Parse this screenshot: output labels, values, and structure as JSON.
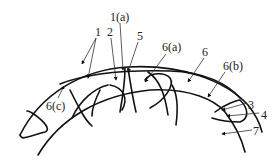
{
  "diagram": {
    "labels": [
      {
        "id": "1",
        "text": "1",
        "x": 95,
        "y": 26
      },
      {
        "id": "2",
        "text": "2",
        "x": 107,
        "y": 26
      },
      {
        "id": "1a",
        "text": "1(a)",
        "x": 110,
        "y": 11
      },
      {
        "id": "5",
        "text": "5",
        "x": 137,
        "y": 30
      },
      {
        "id": "6a",
        "text": "6(a)",
        "x": 162,
        "y": 41
      },
      {
        "id": "6",
        "text": "6",
        "x": 202,
        "y": 46
      },
      {
        "id": "6b",
        "text": "6(b)",
        "x": 223,
        "y": 60
      },
      {
        "id": "6c",
        "text": "6(c)",
        "x": 46,
        "y": 100
      },
      {
        "id": "3",
        "text": "3",
        "x": 248,
        "y": 99
      },
      {
        "id": "4",
        "text": "4",
        "x": 261,
        "y": 109
      },
      {
        "id": "7",
        "text": "7",
        "x": 253,
        "y": 125
      }
    ],
    "stroke_color": "#111111"
  }
}
